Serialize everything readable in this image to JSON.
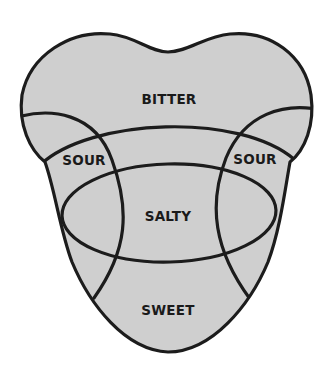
{
  "diagram": {
    "colors": {
      "fill": "#cfcfcf",
      "outline": "#1c1c1c",
      "label": "#1a1a1a",
      "background": "#ffffff"
    },
    "regions": [
      {
        "id": "bitter",
        "label": "BITTER",
        "x": 169,
        "y": 104
      },
      {
        "id": "sour-left",
        "label": "SOUR",
        "x": 84,
        "y": 165
      },
      {
        "id": "sour-right",
        "label": "SOUR",
        "x": 255,
        "y": 164
      },
      {
        "id": "salty",
        "label": "SALTY",
        "x": 168,
        "y": 221
      },
      {
        "id": "sweet",
        "label": "SWEET",
        "x": 168,
        "y": 315
      }
    ]
  }
}
